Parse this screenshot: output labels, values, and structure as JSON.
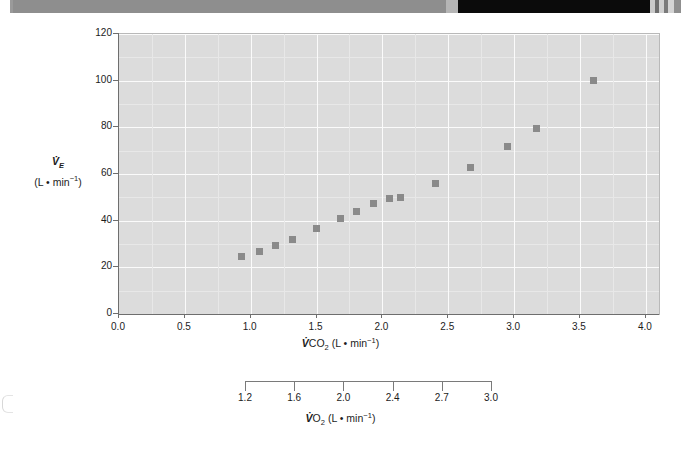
{
  "figure": {
    "background_color": "#ffffff",
    "plot_background_color": "#dcdcdc",
    "gridline_color": "#fbfbfb",
    "marker_color": "#8a8a8a"
  },
  "scan_band": {
    "segments": [
      {
        "name": "left-white",
        "left": 0,
        "width": 10,
        "color": "#ffffff"
      },
      {
        "name": "left-edge-dark",
        "left": 10,
        "width": 3,
        "color": "#9a9a9a"
      },
      {
        "name": "gray-main",
        "left": 13,
        "width": 445,
        "color": "#8e8e8e"
      },
      {
        "name": "gray-fade",
        "left": 446,
        "width": 12,
        "color": "#b5b5b5"
      },
      {
        "name": "black-main",
        "left": 458,
        "width": 192,
        "color": "#0b0b0b"
      },
      {
        "name": "stripe-1",
        "left": 650,
        "width": 5,
        "color": "#c9c9c9"
      },
      {
        "name": "stripe-2",
        "left": 655,
        "width": 4,
        "color": "#6e6e6e"
      },
      {
        "name": "stripe-3",
        "left": 659,
        "width": 5,
        "color": "#cfcfcf"
      },
      {
        "name": "stripe-4",
        "left": 664,
        "width": 4,
        "color": "#7a7a7a"
      },
      {
        "name": "stripe-5",
        "left": 668,
        "width": 6,
        "color": "#d4d4d4"
      },
      {
        "name": "stripe-6",
        "left": 674,
        "width": 7,
        "color": "#8f8f8f"
      }
    ]
  },
  "chart_data": {
    "type": "scatter",
    "title": "",
    "xlabel": "V̇CO₂ (L • min⁻¹)",
    "ylabel": "V̇ᴇ (L • min⁻¹)",
    "xlim": [
      0.0,
      4.1
    ],
    "ylim": [
      0,
      120
    ],
    "grid": true,
    "legend": null,
    "x": [
      0.93,
      1.07,
      1.19,
      1.32,
      1.5,
      1.68,
      1.8,
      1.93,
      2.05,
      2.14,
      2.4,
      2.67,
      2.95,
      3.17,
      3.6
    ],
    "y": [
      24.5,
      27.0,
      29.5,
      32.0,
      36.5,
      41.0,
      44.0,
      47.5,
      49.5,
      49.8,
      56.0,
      63.0,
      72.0,
      79.5,
      100.0
    ],
    "points": [
      {
        "x": 0.93,
        "y": 24.5
      },
      {
        "x": 1.07,
        "y": 27.0
      },
      {
        "x": 1.19,
        "y": 29.5
      },
      {
        "x": 1.32,
        "y": 32.0
      },
      {
        "x": 1.5,
        "y": 36.5
      },
      {
        "x": 1.68,
        "y": 41.0
      },
      {
        "x": 1.8,
        "y": 44.0
      },
      {
        "x": 1.93,
        "y": 47.5
      },
      {
        "x": 2.05,
        "y": 49.5
      },
      {
        "x": 2.14,
        "y": 49.8
      },
      {
        "x": 2.4,
        "y": 56.0
      },
      {
        "x": 2.67,
        "y": 63.0
      },
      {
        "x": 2.95,
        "y": 72.0
      },
      {
        "x": 3.17,
        "y": 79.5
      },
      {
        "x": 3.6,
        "y": 100.0
      }
    ],
    "y_axis": {
      "ticks": [
        0,
        20,
        40,
        60,
        80,
        100,
        120
      ],
      "tick_labels": [
        "0",
        "20",
        "40",
        "60",
        "80",
        "100",
        "120"
      ],
      "title_line1": "V̇",
      "title_line1_sub": "E",
      "title_line2": "(L • min",
      "title_line2_sup": "−1",
      "title_line2_end": ")"
    },
    "x_axis": {
      "ticks": [
        0.0,
        0.5,
        1.0,
        1.5,
        2.0,
        2.5,
        3.0,
        3.5,
        4.0
      ],
      "tick_labels": [
        "0.0",
        "0.5",
        "1.0",
        "1.5",
        "2.0",
        "2.5",
        "3.0",
        "3.5",
        "4.0"
      ],
      "title_prefix": "V̇",
      "title_main": "CO",
      "title_sub": "2",
      "title_units": " (L • min",
      "title_sup": "−1",
      "title_end": ")"
    },
    "secondary_axis": {
      "name": "VO2-axis",
      "tick_labels": [
        "1.2",
        "1.6",
        "2.0",
        "2.4",
        "2.7",
        "3.0"
      ],
      "tick_positions_pct": [
        0,
        20,
        40,
        60,
        80,
        100
      ],
      "title_prefix": "V̇",
      "title_main": "O",
      "title_sub": "2",
      "title_units": " (L • min",
      "title_sup": "−1",
      "title_end": ")"
    }
  }
}
